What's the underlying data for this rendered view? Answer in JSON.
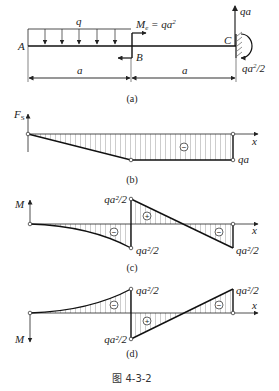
{
  "figure": {
    "caption": "图 4-3-2",
    "beam": {
      "label_A": "A",
      "label_B": "B",
      "label_C": "C",
      "load_q": "q",
      "moment_label": "M",
      "moment_sub": "e",
      "moment_value": " = qa",
      "moment_exp": "2",
      "reaction_force": "qa",
      "reaction_moment": "qa",
      "reaction_moment_tail": "2/2",
      "span_left": "a",
      "span_right": "a",
      "sublabel": "(a)"
    },
    "shear": {
      "axis_label": "F",
      "axis_sub": "S",
      "x_label": "x",
      "sign": "−",
      "value_right": "qa",
      "sublabel": "(b)"
    },
    "moment_c": {
      "axis_label": "M",
      "x_label": "x",
      "value_B_top": "qa²/2",
      "value_B_bottom": "qa²/2",
      "value_C": "qa²/2",
      "signs": [
        "−",
        "+",
        "−"
      ],
      "sublabel": "(c)"
    },
    "moment_d": {
      "axis_label": "M",
      "x_label": "x",
      "value_B_top": "qa²/2",
      "value_B_bottom": "qa²/2",
      "value_C": "qa²/2",
      "signs": [
        "−",
        "+",
        "−"
      ],
      "sublabel": "(d)"
    }
  }
}
